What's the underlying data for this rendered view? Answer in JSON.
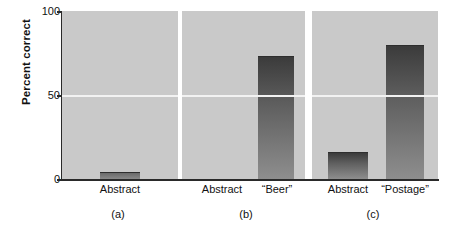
{
  "chart_data": {
    "type": "bar",
    "title": "",
    "xlabel": "",
    "ylabel": "Percent correct",
    "ylim": [
      0,
      100
    ],
    "yticks": [
      0,
      50,
      100
    ],
    "ytick_labels": [
      "0",
      "50",
      "100"
    ],
    "grid": false,
    "legend": null,
    "panels": [
      {
        "caption": "(a)",
        "categories": [
          "Abstract"
        ],
        "values": [
          4
        ]
      },
      {
        "caption": "(b)",
        "categories": [
          "Abstract",
          "“Beer”"
        ],
        "values": [
          0,
          73
        ]
      },
      {
        "caption": "(c)",
        "categories": [
          "Abstract",
          "“Postage”"
        ],
        "values": [
          16,
          80
        ]
      }
    ]
  },
  "axis": {
    "ylabel": "Percent correct",
    "ytick_top": "100",
    "ytick_mid": "50",
    "ytick_bottom": "0"
  },
  "panel_a": {
    "caption": "(a)",
    "bar1_label": "Abstract",
    "bar1_value": 4
  },
  "panel_b": {
    "caption": "(b)",
    "bar1_label": "Abstract",
    "bar1_value": 0,
    "bar2_label": "“Beer”",
    "bar2_value": 73
  },
  "panel_c": {
    "caption": "(c)",
    "bar1_label": "Abstract",
    "bar1_value": 16,
    "bar2_label": "“Postage”",
    "bar2_value": 80
  },
  "colors": {
    "plot_background": "#c9c9c9",
    "bar_top": "#3b3b3b",
    "bar_bottom": "#8e8e8e",
    "axis": "#2a2a2a",
    "page_background": "#ffffff"
  }
}
